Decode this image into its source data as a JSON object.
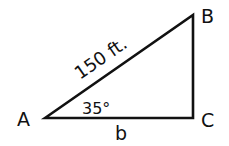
{
  "diagram": {
    "type": "right-triangle",
    "vertices": {
      "A": {
        "label": "A",
        "x": 45,
        "y": 118
      },
      "B": {
        "label": "B",
        "x": 193,
        "y": 15
      },
      "C": {
        "label": "C",
        "x": 193,
        "y": 118
      }
    },
    "sides": {
      "hypotenuse": {
        "from": "A",
        "to": "B",
        "label": "150 ft."
      },
      "base": {
        "from": "A",
        "to": "C",
        "label": "b"
      },
      "vertical": {
        "from": "C",
        "to": "B",
        "label": ""
      }
    },
    "angles": {
      "A": {
        "label": "35°"
      }
    },
    "stroke_color": "#111111",
    "background": "#ffffff"
  }
}
